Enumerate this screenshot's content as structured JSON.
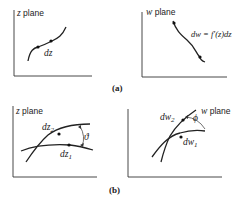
{
  "panel_a": {
    "z_plane": {
      "label_var": "z",
      "label_text": " plane",
      "point_label": "dz"
    },
    "w_plane": {
      "label_var": "w",
      "label_text": " plane",
      "mapping_label": "dw = f′(z)dz"
    },
    "caption": "(a)"
  },
  "panel_b": {
    "z_plane": {
      "label_var": "z",
      "label_text": " plane",
      "point1": "dz",
      "point1_sub": "1",
      "point2": "dz",
      "point2_sub": "2",
      "angle": "ϑ"
    },
    "w_plane": {
      "label_var": "w",
      "label_text": " plane",
      "point1": "dw",
      "point1_sub": "1",
      "point2": "dw",
      "point2_sub": "2",
      "angle": "ϕ"
    },
    "caption": "(b)"
  }
}
